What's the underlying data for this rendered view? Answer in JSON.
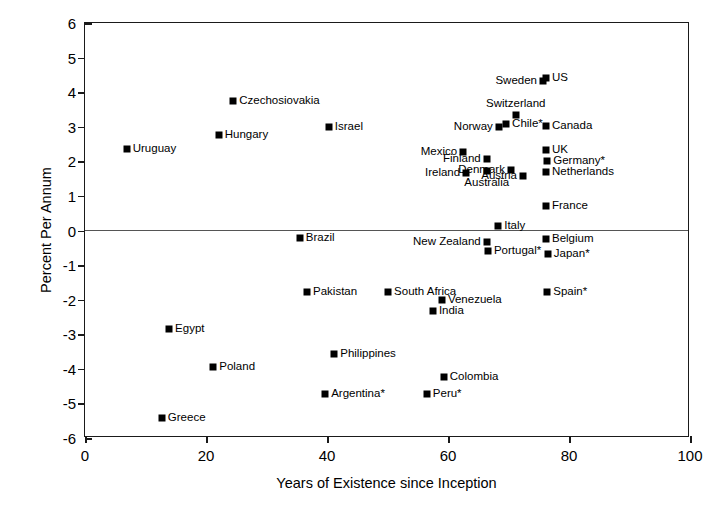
{
  "chart_data": {
    "type": "scatter",
    "title": "",
    "xlabel": "Years of Existence since Inception",
    "ylabel": "Percent Per Annum",
    "xlim": [
      0,
      100
    ],
    "ylim": [
      -6,
      6
    ],
    "xticks": [
      0,
      20,
      40,
      60,
      80,
      100
    ],
    "yticks": [
      6,
      5,
      4,
      3,
      2,
      1,
      0,
      -1,
      -2,
      -3,
      -4,
      -5,
      -6
    ],
    "grid": false,
    "legend": "none",
    "zero_reference_line": true,
    "marker": "filled-square",
    "marker_color": "#000000",
    "note": "Labels marked with an asterisk (*) appear as printed in the source figure.",
    "points": [
      {
        "label": "Uruguay",
        "x": 6.9,
        "y": 2.35,
        "pos": "right"
      },
      {
        "label": "Czechosiovakia",
        "x": 24.5,
        "y": 3.75,
        "pos": "right"
      },
      {
        "label": "Hungary",
        "x": 22.1,
        "y": 2.76,
        "pos": "right"
      },
      {
        "label": "Israel",
        "x": 40.3,
        "y": 3.0,
        "pos": "right"
      },
      {
        "label": "Sweden",
        "x": 75.7,
        "y": 4.32,
        "pos": "left"
      },
      {
        "label": "US",
        "x": 76.2,
        "y": 4.4,
        "pos": "right"
      },
      {
        "label": "Switzerland",
        "x": 71.2,
        "y": 3.35,
        "pos": "above"
      },
      {
        "label": "Canada",
        "x": 76.2,
        "y": 3.03,
        "pos": "right"
      },
      {
        "label": "Norway",
        "x": 68.4,
        "y": 3.0,
        "pos": "left"
      },
      {
        "label": "Chile*",
        "x": 69.6,
        "y": 3.09,
        "pos": "right"
      },
      {
        "label": "Mexico",
        "x": 62.5,
        "y": 2.28,
        "pos": "left"
      },
      {
        "label": "UK",
        "x": 76.2,
        "y": 2.34,
        "pos": "right"
      },
      {
        "label": "Finland",
        "x": 66.4,
        "y": 2.08,
        "pos": "left"
      },
      {
        "label": "Germany*",
        "x": 76.4,
        "y": 2.02,
        "pos": "right"
      },
      {
        "label": "Denmark",
        "x": 70.4,
        "y": 1.76,
        "pos": "left"
      },
      {
        "label": "Ireland",
        "x": 63.0,
        "y": 1.65,
        "pos": "left"
      },
      {
        "label": "Australia",
        "x": 66.4,
        "y": 1.71,
        "pos": "below"
      },
      {
        "label": "Austria",
        "x": 72.4,
        "y": 1.59,
        "pos": "left"
      },
      {
        "label": "Netherlands",
        "x": 76.2,
        "y": 1.68,
        "pos": "right"
      },
      {
        "label": "France",
        "x": 76.2,
        "y": 0.72,
        "pos": "right"
      },
      {
        "label": "Italy",
        "x": 68.3,
        "y": 0.14,
        "pos": "right"
      },
      {
        "label": "Brazil",
        "x": 35.5,
        "y": -0.23,
        "pos": "right"
      },
      {
        "label": "New Zealand",
        "x": 66.4,
        "y": -0.32,
        "pos": "left"
      },
      {
        "label": "Belgium",
        "x": 76.2,
        "y": -0.26,
        "pos": "right"
      },
      {
        "label": "Portugal*",
        "x": 66.6,
        "y": -0.58,
        "pos": "right"
      },
      {
        "label": "Japan*",
        "x": 76.5,
        "y": -0.67,
        "pos": "right"
      },
      {
        "label": "Pakistan",
        "x": 36.7,
        "y": -1.77,
        "pos": "right"
      },
      {
        "label": "South Africa",
        "x": 50.1,
        "y": -1.77,
        "pos": "right"
      },
      {
        "label": "Spain*",
        "x": 76.4,
        "y": -1.77,
        "pos": "right"
      },
      {
        "label": "Venezuela",
        "x": 59.0,
        "y": -2.0,
        "pos": "right"
      },
      {
        "label": "India",
        "x": 57.5,
        "y": -2.34,
        "pos": "right"
      },
      {
        "label": "Egypt",
        "x": 13.9,
        "y": -2.85,
        "pos": "right"
      },
      {
        "label": "Philippines",
        "x": 41.2,
        "y": -3.58,
        "pos": "right"
      },
      {
        "label": "Poland",
        "x": 21.2,
        "y": -3.94,
        "pos": "right"
      },
      {
        "label": "Colombia",
        "x": 59.3,
        "y": -4.23,
        "pos": "right"
      },
      {
        "label": "Argentina*",
        "x": 39.7,
        "y": -4.72,
        "pos": "right"
      },
      {
        "label": "Peru*",
        "x": 56.5,
        "y": -4.72,
        "pos": "right"
      },
      {
        "label": "Greece",
        "x": 12.7,
        "y": -5.43,
        "pos": "right"
      }
    ]
  }
}
